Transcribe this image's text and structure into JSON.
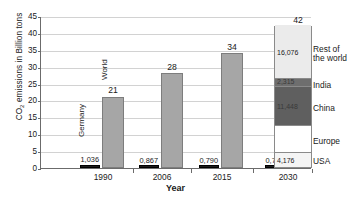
{
  "chart_data": {
    "type": "bar",
    "title": "",
    "xlabel": "Year",
    "ylabel": "CO2 emissions in Billion tons",
    "ylabel_prefix": "CO",
    "ylabel_sub": "2",
    "ylabel_suffix": " emissions in Billion tons",
    "categories": [
      "1990",
      "2006",
      "2015",
      "2030"
    ],
    "ylim": [
      0,
      45
    ],
    "yticks": [
      "0",
      "5",
      "10",
      "15",
      "20",
      "25",
      "30",
      "35",
      "40",
      "45"
    ],
    "grid": true,
    "legend_position": "right",
    "series": [
      {
        "name": "Germany",
        "color": "#1c1c1c",
        "values": [
          1.036,
          0.867,
          0.79,
          0.72
        ],
        "labels": [
          "1,036",
          "0,867",
          "0,790",
          "0,720"
        ]
      },
      {
        "name": "World",
        "color": "#a6a6a6",
        "values": [
          21,
          28,
          34,
          42
        ],
        "labels": [
          "21",
          "28",
          "34",
          "42"
        ]
      }
    ],
    "stacked_breakdown": {
      "year": "2030",
      "total": 42,
      "segments": [
        {
          "name": "Rest of the world",
          "value": 16.076,
          "label": "16,076",
          "color": "#ebebeb"
        },
        {
          "name": "India",
          "value": 2.315,
          "label": "2,315",
          "color": "#6e6e6e"
        },
        {
          "name": "China",
          "value": 11.448,
          "label": "11,448",
          "color": "#5f5f5f"
        },
        {
          "name": "Europe",
          "value": 7.985,
          "label": "",
          "color": "#ffffff"
        },
        {
          "name": "USA",
          "value": 4.176,
          "label": "4,176",
          "color": "#f4f4f4"
        }
      ]
    },
    "legend": [
      {
        "label_line1": "Rest of",
        "label_line2": "the world"
      },
      {
        "label_line1": "India",
        "label_line2": ""
      },
      {
        "label_line1": "China",
        "label_line2": ""
      },
      {
        "label_line1": "Europe",
        "label_line2": ""
      },
      {
        "label_line1": "USA",
        "label_line2": ""
      }
    ]
  }
}
